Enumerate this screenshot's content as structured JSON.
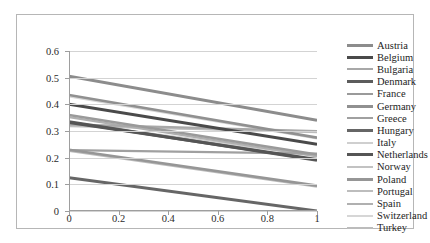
{
  "chart_data": {
    "type": "line",
    "title": "",
    "xlabel": "",
    "ylabel": "",
    "xlim": [
      0,
      1
    ],
    "ylim": [
      0,
      0.6
    ],
    "x_ticks": [
      "0",
      "0.2",
      "0.4",
      "0.6",
      "0.8",
      "1"
    ],
    "x_tick_values": [
      0,
      0.2,
      0.4,
      0.6,
      0.8,
      1
    ],
    "y_ticks": [
      "0",
      "0.1",
      "0.2",
      "0.3",
      "0.4",
      "0.5",
      "0.6"
    ],
    "y_tick_values": [
      0,
      0.1,
      0.2,
      0.3,
      0.4,
      0.5,
      0.6
    ],
    "grid": true,
    "legend_position": "right",
    "x": [
      0,
      1
    ],
    "series": [
      {
        "name": "Austria",
        "values": [
          0.505,
          0.34
        ],
        "color": "#8c8c8c",
        "width": 3.0
      },
      {
        "name": "Belgium",
        "values": [
          0.4,
          0.25
        ],
        "color": "#4a4a4a",
        "width": 3.0
      },
      {
        "name": "Bulgaria",
        "values": [
          0.325,
          0.3
        ],
        "color": "#a8a8a8",
        "width": 2.2
      },
      {
        "name": "Denmark",
        "values": [
          0.335,
          0.19
        ],
        "color": "#5c5c5c",
        "width": 3.0
      },
      {
        "name": "France",
        "values": [
          0.36,
          0.212
        ],
        "color": "#9a9a9a",
        "width": 2.4
      },
      {
        "name": "Germany",
        "values": [
          0.435,
          0.275
        ],
        "color": "#909090",
        "width": 2.6
      },
      {
        "name": "Greece",
        "values": [
          0.228,
          0.215
        ],
        "color": "#a0a0a0",
        "width": 2.2
      },
      {
        "name": "Hungary",
        "values": [
          0.125,
          0.0
        ],
        "color": "#666666",
        "width": 3.0
      },
      {
        "name": "Italy",
        "values": [
          0.33,
          0.208
        ],
        "color": "#cfcfcf",
        "width": 2.4
      },
      {
        "name": "Netherlands",
        "values": [
          0.332,
          0.193
        ],
        "color": "#555555",
        "width": 3.0
      },
      {
        "name": "Norway",
        "values": [
          0.318,
          0.298
        ],
        "color": "#c2c2c2",
        "width": 2.2
      },
      {
        "name": "Poland",
        "values": [
          0.23,
          0.095
        ],
        "color": "#969696",
        "width": 2.6
      },
      {
        "name": "Portugal",
        "values": [
          0.226,
          0.092
        ],
        "color": "#bdbdbd",
        "width": 2.4
      },
      {
        "name": "Spain",
        "values": [
          0.352,
          0.205
        ],
        "color": "#b0b0b0",
        "width": 2.2
      },
      {
        "name": "Switzerland",
        "values": [
          0.43,
          0.272
        ],
        "color": "#d6d6d6",
        "width": 2.2
      },
      {
        "name": "Turkey",
        "values": [
          0.322,
          0.296
        ],
        "color": "#bcbcbc",
        "width": 2.2
      }
    ]
  },
  "legend": {
    "items": [
      {
        "label": "Austria"
      },
      {
        "label": "Belgium"
      },
      {
        "label": "Bulgaria"
      },
      {
        "label": "Denmark"
      },
      {
        "label": "France"
      },
      {
        "label": "Germany"
      },
      {
        "label": "Greece"
      },
      {
        "label": "Hungary"
      },
      {
        "label": "Italy"
      },
      {
        "label": "Netherlands"
      },
      {
        "label": "Norway"
      },
      {
        "label": "Poland"
      },
      {
        "label": "Portugal"
      },
      {
        "label": "Spain"
      },
      {
        "label": "Switzerland"
      },
      {
        "label": "Turkey"
      }
    ]
  },
  "colors": {
    "frame": "#b6b6b6",
    "grid": "#d3d3d3",
    "axis": "#9e9e9e",
    "text": "#2b2b2b",
    "background": "#ffffff"
  }
}
